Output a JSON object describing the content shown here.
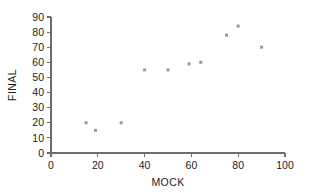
{
  "chart_data": {
    "type": "scatter",
    "title": "",
    "subtitle": "",
    "xlabel": "MOCK",
    "ylabel": "FINAL",
    "xlim": [
      0,
      100
    ],
    "ylim": [
      0,
      90
    ],
    "xticks": [
      0,
      20,
      40,
      60,
      80,
      100
    ],
    "yticks": [
      0,
      10,
      20,
      30,
      40,
      50,
      60,
      70,
      80,
      90
    ],
    "xtick_labels": [
      "0",
      "20",
      "40",
      "60",
      "80",
      "100"
    ],
    "ytick_labels": [
      "0",
      "10",
      "20",
      "30",
      "40",
      "50",
      "60",
      "70",
      "80",
      "90"
    ],
    "grid": false,
    "legend": false,
    "legend_position": "none",
    "marker": "square",
    "marker_color": "#9a9a9a",
    "marker_size": 3,
    "axis_color": "#6d6d6d",
    "text_color": "#1c1c1c",
    "background_color": "#ffffff",
    "points": [
      {
        "x": 15,
        "y": 20
      },
      {
        "x": 19,
        "y": 15
      },
      {
        "x": 30,
        "y": 20
      },
      {
        "x": 40,
        "y": 55
      },
      {
        "x": 50,
        "y": 55
      },
      {
        "x": 59,
        "y": 59
      },
      {
        "x": 64,
        "y": 60
      },
      {
        "x": 75,
        "y": 78
      },
      {
        "x": 80,
        "y": 84
      },
      {
        "x": 90,
        "y": 70
      }
    ],
    "series": [
      {
        "name": "MOCK vs FINAL",
        "x": [
          15,
          19,
          30,
          40,
          50,
          59,
          64,
          75,
          80,
          90
        ],
        "values": [
          20,
          15,
          20,
          55,
          55,
          59,
          60,
          78,
          84,
          70
        ]
      }
    ]
  }
}
